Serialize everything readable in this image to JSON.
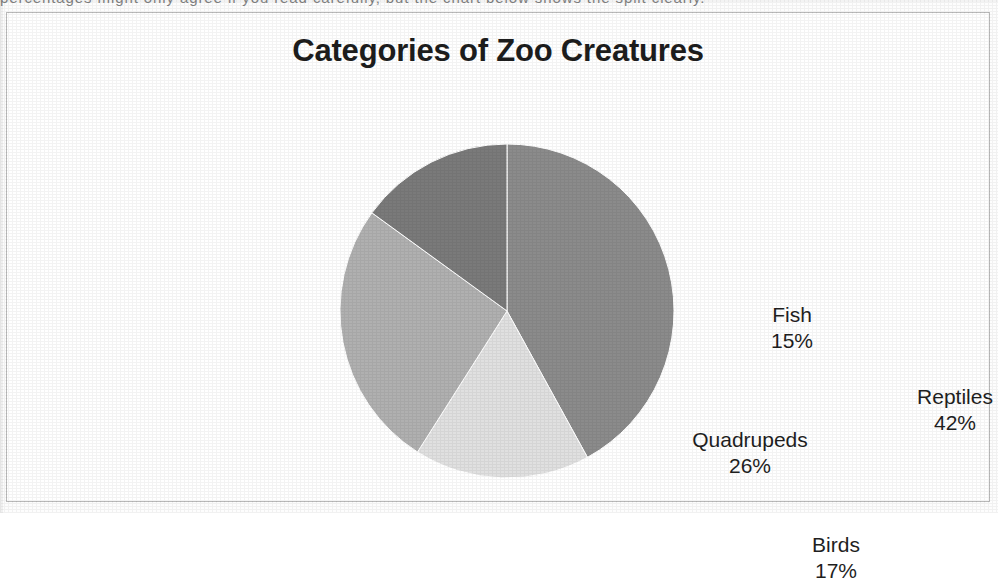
{
  "document": {
    "clipped_top_text": "percentages might only agree if you read carefully, but the chart below shows the split clearly."
  },
  "chart": {
    "title": "Categories of Zoo Creatures",
    "frame_border_color": "#b9b9b9",
    "background_color": "#ffffff"
  },
  "chart_data": {
    "type": "pie",
    "title": "Categories of Zoo Creatures",
    "xlabel": "",
    "ylabel": "",
    "categories": [
      "Reptiles",
      "Birds",
      "Quadrupeds",
      "Fish"
    ],
    "values": [
      42,
      17,
      26,
      15
    ],
    "value_unit": "%",
    "start_angle_deg": 0,
    "direction": "clockwise",
    "legend": "none",
    "labels_position": "inside-slice",
    "grid": false,
    "colors": [
      "#8b8b8b",
      "#e0e0e0",
      "#b0b0b0",
      "#7a7a7a"
    ],
    "slices": [
      {
        "name": "Reptiles",
        "value": 42,
        "label": "Reptiles",
        "value_label": "42%",
        "color": "#8b8b8b"
      },
      {
        "name": "Birds",
        "value": 17,
        "label": "Birds",
        "value_label": "17%",
        "color": "#e0e0e0"
      },
      {
        "name": "Quadrupeds",
        "value": 26,
        "label": "Quadrupeds",
        "value_label": "26%",
        "color": "#b0b0b0"
      },
      {
        "name": "Fish",
        "value": 15,
        "label": "Fish",
        "value_label": "15%",
        "color": "#7a7a7a"
      }
    ]
  }
}
